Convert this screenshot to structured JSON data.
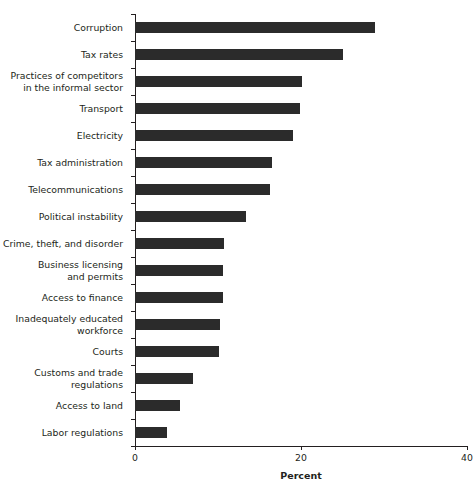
{
  "figure": {
    "clipped_caption": "",
    "x_axis_title": "Percent"
  },
  "chart_data": {
    "type": "bar",
    "orientation": "horizontal",
    "title": "",
    "subtitle": "",
    "xlabel": "Percent",
    "ylabel": "",
    "xlim": [
      0,
      40
    ],
    "xticks": [
      0,
      20,
      40
    ],
    "xticklabels": [
      "0",
      "20",
      "40"
    ],
    "grid": false,
    "legend": null,
    "bar_color": "#2b2b2b",
    "highlight_color": "#5c5c5c",
    "highlight_category": "Inadequately educated workforce",
    "categories": [
      "Corruption",
      "Tax rates",
      "Practices of competitors\nin the informal sector",
      "Transport",
      "Electricity",
      "Tax administration",
      "Telecommunications",
      "Political instability",
      "Crime, theft, and disorder",
      "Business licensing\nand permits",
      "Access to finance",
      "Inadequately educated\nworkforce",
      "Courts",
      "Customs and trade\nregulations",
      "Access to land",
      "Labor regulations"
    ],
    "values": [
      28.9,
      25.0,
      20.1,
      19.9,
      19.0,
      16.5,
      16.3,
      13.4,
      10.7,
      10.6,
      10.6,
      10.2,
      10.1,
      7.0,
      5.4,
      3.9
    ]
  }
}
